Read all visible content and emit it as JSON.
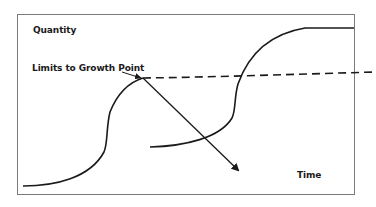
{
  "diagram": {
    "title": "",
    "labels": {
      "y_axis": "Quantity",
      "x_axis": "Time",
      "annotation": "Limits to Growth Point"
    },
    "elements": [
      {
        "id": "growth-curve-1",
        "type": "s-curve",
        "description": "First S-shaped growth curve rising to the limits to growth point"
      },
      {
        "id": "decline-arrow",
        "type": "arrow",
        "description": "Arrow from the limits to growth point descending down and to the right"
      },
      {
        "id": "limit-line",
        "type": "dashed-line",
        "description": "Dashed horizontal line extending from the limits to growth point"
      },
      {
        "id": "growth-curve-2",
        "type": "s-curve",
        "description": "Second S-shaped growth curve rising past the limit line and leveling off at top"
      },
      {
        "id": "annotation-pointer",
        "type": "arrow",
        "description": "Small arrow pointing from label to the limits to growth point"
      }
    ],
    "colors": {
      "frame": "#7a7a7a",
      "stroke": "#1a1a1a",
      "background": "#ffffff"
    }
  }
}
